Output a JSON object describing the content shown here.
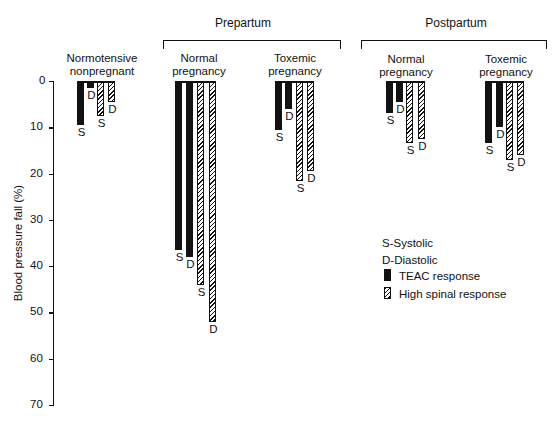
{
  "chart_data": {
    "type": "bar",
    "title": "",
    "xlabel": "",
    "ylabel": "Blood pressure fall (%)",
    "ylim": [
      0,
      70
    ],
    "y_inverted": true,
    "yticks": [
      "0",
      "10",
      "20",
      "30",
      "40",
      "50",
      "60",
      "70"
    ],
    "grid": false,
    "super_groups": [
      "Prepartum",
      "Postpartum"
    ],
    "categories": [
      "Normotensive nonpregnant",
      "Prepartum Normal pregnancy",
      "Prepartum Toxemic pregnancy",
      "Postpartum Normal pregnancy",
      "Postpartum Toxemic pregnancy"
    ],
    "series": [
      {
        "name": "TEAC response - Systolic",
        "values": [
          9.5,
          36.5,
          10.5,
          7,
          13.5
        ]
      },
      {
        "name": "TEAC response - Diastolic",
        "values": [
          1.5,
          38,
          6,
          4.5,
          10
        ]
      },
      {
        "name": "High spinal response - Systolic",
        "values": [
          7.5,
          44,
          21.5,
          13.5,
          17
        ]
      },
      {
        "name": "High spinal response - Diastolic",
        "values": [
          4.5,
          52,
          19.5,
          12.5,
          16
        ]
      }
    ],
    "legend": {
      "position": "right-middle",
      "entries": [
        "S-Systolic",
        "D-Diastolic",
        "TEAC response",
        "High spinal response"
      ]
    }
  },
  "labels": {
    "ylabel": "Blood pressure fall (%)",
    "prepartum": "Prepartum",
    "postpartum": "Postpartum",
    "group0_l1": "Normotensive",
    "group0_l2": "nonpregnant",
    "group1_l1": "Normal",
    "group1_l2": "pregnancy",
    "group2_l1": "Toxemic",
    "group2_l2": "pregnancy",
    "group3_l1": "Normal",
    "group3_l2": "pregnancy",
    "group4_l1": "Toxemic",
    "group4_l2": "pregnancy",
    "S": "S",
    "D": "D",
    "legend_s": "S-Systolic",
    "legend_d": "D-Diastolic",
    "legend_teac": "TEAC response",
    "legend_spinal": "High spinal response"
  }
}
